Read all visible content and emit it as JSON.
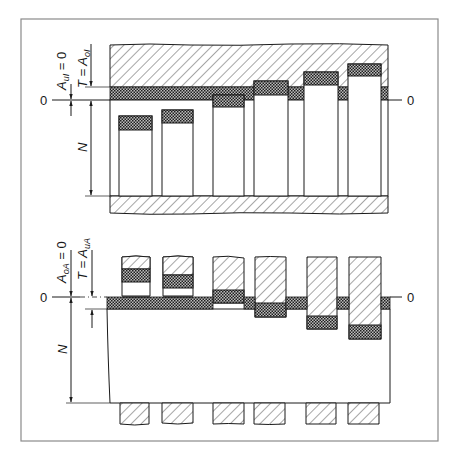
{
  "figure": {
    "type": "technical-diagram",
    "colors": {
      "line": "#1a1a1a",
      "frame": "#8a8a8a",
      "background": "#ffffff",
      "hatch": "#333333",
      "crosshatch": "#2a2a2a"
    }
  },
  "upper_diagram": {
    "name": "hole-basis system (Einheitsbohrung)",
    "zero_label_left": "0",
    "zero_label_right": "0",
    "label_deviation": "A",
    "label_deviation_sub": "uI",
    "label_deviation_rest": " = 0",
    "label_tolerance_prefix": "T = A",
    "label_tolerance_sub": "oI",
    "label_nominal": "N",
    "rods": [
      {
        "index": 1,
        "x": 119,
        "w": 33,
        "top": 116,
        "tol": 14
      },
      {
        "index": 2,
        "x": 162,
        "w": 31,
        "top": 110,
        "tol": 13
      },
      {
        "index": 3,
        "x": 213,
        "w": 31,
        "top": 95,
        "tol": 12
      },
      {
        "index": 4,
        "x": 254,
        "w": 34,
        "top": 81,
        "tol": 14
      },
      {
        "index": 5,
        "x": 304,
        "w": 34,
        "top": 72,
        "tol": 13
      },
      {
        "index": 6,
        "x": 348,
        "w": 33,
        "top": 64,
        "tol": 12
      }
    ]
  },
  "lower_diagram": {
    "name": "shaft-basis system (Einheitswelle)",
    "zero_label_left": "0",
    "zero_label_right": "0",
    "label_deviation": "A",
    "label_deviation_sub": "oA",
    "label_deviation_rest": " = 0",
    "label_tolerance_prefix": "T = A",
    "label_tolerance_sub": "uA",
    "label_nominal": "N",
    "holes": [
      {
        "index": 1,
        "x": 122,
        "w": 28,
        "tol_top": 269,
        "tol_bot": 282,
        "bottom": 296
      },
      {
        "index": 2,
        "x": 163,
        "w": 30,
        "tol_top": 275,
        "tol_bot": 288,
        "bottom": 296
      },
      {
        "index": 3,
        "x": 213,
        "w": 31,
        "tol_top": 290,
        "tol_bot": 303,
        "bottom": 303
      },
      {
        "index": 4,
        "x": 255,
        "w": 31,
        "tol_top": 303,
        "tol_bot": 317,
        "bottom": 317
      },
      {
        "index": 5,
        "x": 307,
        "w": 30,
        "tol_top": 316,
        "tol_bot": 329,
        "bottom": 329
      },
      {
        "index": 6,
        "x": 349,
        "w": 32,
        "tol_top": 325,
        "tol_bot": 339,
        "bottom": 339
      }
    ],
    "stubs": [
      {
        "x": 120,
        "w": 29
      },
      {
        "x": 162,
        "w": 31
      },
      {
        "x": 213,
        "w": 31
      },
      {
        "x": 254,
        "w": 31
      },
      {
        "x": 306,
        "w": 30
      },
      {
        "x": 348,
        "w": 31
      }
    ]
  }
}
